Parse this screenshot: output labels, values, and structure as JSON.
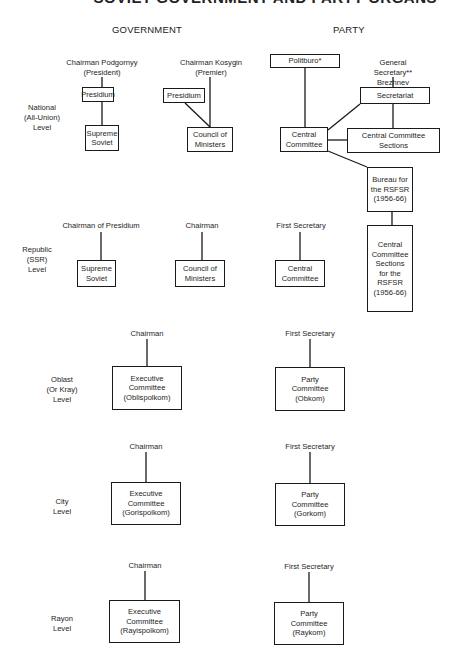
{
  "title": "SOVIET GOVERNMENT AND PARTY ORGANS",
  "columns": {
    "government": "GOVERNMENT",
    "party": "PARTY"
  },
  "levels": {
    "national": "National\n(All-Union)\nLevel",
    "republic": "Republic\n(SSR)\nLevel",
    "oblast": "Oblast\n(Or Kray)\nLevel",
    "city": "City\nLevel",
    "rayon": "Rayon\nLevel"
  },
  "national": {
    "gov_presidium_head": "Chairman Podgornyy\n(President)",
    "gov_presidium": "Presidium",
    "gov_supreme_soviet": "Supreme\nSoviet",
    "gov_council_head": "Chairman Kosygin\n(Premier)",
    "gov_council_presidium": "Presidium",
    "gov_council": "Council of\nMinisters",
    "party_politburo": "Politburo*",
    "party_gensec": "General Secretary**\nBrezhnev",
    "party_secretariat": "Secretariat",
    "party_cc": "Central\nCommittee",
    "party_cc_sections": "Central Committee\nSections",
    "party_bureau_rsfsr": "Bureau for\nthe RSFSR\n(1956-66)",
    "party_cc_sections_rsfsr": "Central\nCommittee\nSections\nfor the\nRSFSR\n(1956-66)"
  },
  "republic": {
    "gov_ss_head": "Chairman of Presidium",
    "gov_ss": "Supreme\nSoviet",
    "gov_council_head": "Chairman",
    "gov_council": "Council of\nMinisters",
    "party_head": "First Secretary",
    "party_cc": "Central\nCommittee"
  },
  "oblast": {
    "gov_head": "Chairman",
    "gov_body": "Executive\nCommittee\n(Oblispolkom)",
    "party_head": "First Secretary",
    "party_body": "Party\nCommittee\n(Obkom)"
  },
  "city": {
    "gov_head": "Chairman",
    "gov_body": "Executive\nCommittee\n(Gorispolkom)",
    "party_head": "First Secretary",
    "party_body": "Party\nCommittee\n(Gorkom)"
  },
  "rayon": {
    "gov_head": "Chairman",
    "gov_body": "Executive\nCommittee\n(Rayispolkom)",
    "party_head": "First Secretary",
    "party_body": "Party\nCommittee\n(Raykom)"
  }
}
